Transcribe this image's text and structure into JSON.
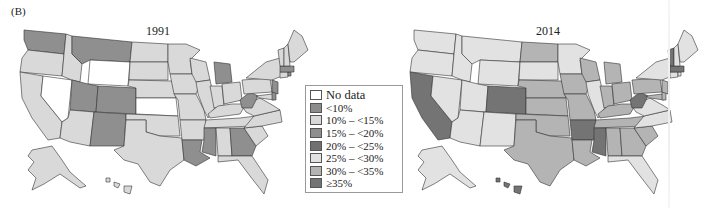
{
  "panel_label": "(B)",
  "legend": {
    "items": [
      {
        "key": "nd",
        "label": "No data",
        "color": "#ffffff"
      },
      {
        "key": "c1",
        "label": "<10%",
        "color": "#8c8c8c"
      },
      {
        "key": "c2",
        "label": "10% – <15%",
        "color": "#d9d9d9"
      },
      {
        "key": "c3",
        "label": "15% – <20%",
        "color": "#8f8f8f"
      },
      {
        "key": "c4",
        "label": "20% – <25%",
        "color": "#707070"
      },
      {
        "key": "c5",
        "label": "25% – <30%",
        "color": "#e2e2e2"
      },
      {
        "key": "c6",
        "label": "30% – <35%",
        "color": "#b4b4b4"
      },
      {
        "key": "c7",
        "label": "≥35%",
        "color": "#747474"
      }
    ]
  },
  "maps": [
    {
      "title": "1991",
      "default_class": "c2",
      "states": {
        "WA": "c3",
        "MT": "c3",
        "WY": "nd",
        "NV": "nd",
        "UT": "c3",
        "CO": "c3",
        "NM": "c3",
        "KS": "nd",
        "MI": "c3",
        "WV": "c3",
        "GA": "c3",
        "MS": "c3",
        "LA": "c3",
        "NJ": "c3",
        "MA": "c3",
        "RI": "c3",
        "DE": "c3"
      }
    },
    {
      "title": "2014",
      "default_class": "c5",
      "states": {
        "CA": "c7",
        "CO": "c7",
        "AR": "c7",
        "MS": "c7",
        "WV": "c7",
        "VT": "c7",
        "MA": "c7",
        "HI": "c7",
        "ND": "c6",
        "NE": "c6",
        "KS": "c6",
        "OK": "c6",
        "TX": "c6",
        "LA": "c6",
        "IA": "c6",
        "MO": "c6",
        "WI": "c6",
        "MI": "c6",
        "IN": "c6",
        "OH": "c6",
        "KY": "c6",
        "TN": "c6",
        "AL": "c6",
        "GA": "c6",
        "SC": "c6",
        "PA": "c6",
        "NJ": "c6",
        "MD": "c6",
        "DE": "c6"
      }
    }
  ]
}
